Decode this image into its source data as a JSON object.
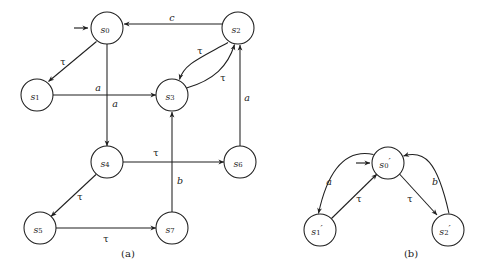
{
  "figure": {
    "background_color": "#ffffff",
    "ink_color": "#1f1f1f",
    "captions": [
      {
        "id": "caption-a",
        "text": "(a)",
        "x": 128,
        "y": 253
      },
      {
        "id": "caption-b",
        "text": "(b)",
        "x": 411,
        "y": 253
      }
    ]
  },
  "diagram_a": {
    "caption": "(a)",
    "initial_state": "s0",
    "nodes": [
      {
        "id": "s0",
        "label": "s",
        "sub": "0",
        "prime": "",
        "cx": 107,
        "cy": 28,
        "r": 16
      },
      {
        "id": "s1",
        "label": "s",
        "sub": "1",
        "prime": "",
        "cx": 37,
        "cy": 95,
        "r": 16
      },
      {
        "id": "s2",
        "label": "s",
        "sub": "2",
        "prime": "",
        "cx": 238,
        "cy": 28,
        "r": 16
      },
      {
        "id": "s3",
        "label": "s",
        "sub": "3",
        "prime": "",
        "cx": 172,
        "cy": 95,
        "r": 16
      },
      {
        "id": "s4",
        "label": "s",
        "sub": "4",
        "prime": "",
        "cx": 107,
        "cy": 162,
        "r": 16
      },
      {
        "id": "s5",
        "label": "s",
        "sub": "5",
        "prime": "",
        "cx": 40,
        "cy": 228,
        "r": 16
      },
      {
        "id": "s6",
        "label": "s",
        "sub": "6",
        "prime": "",
        "cx": 240,
        "cy": 162,
        "r": 16
      },
      {
        "id": "s7",
        "label": "s",
        "sub": "7",
        "prime": "",
        "cx": 172,
        "cy": 228,
        "r": 16
      }
    ],
    "edges": [
      {
        "id": "e-s2-s0",
        "from": "s2",
        "to": "s0",
        "label": "c",
        "kind": "straight",
        "label_x": 172,
        "label_y": 17
      },
      {
        "id": "e-s0-s1",
        "from": "s0",
        "to": "s1",
        "label": "τ",
        "kind": "straight",
        "label_x": 63,
        "label_y": 61
      },
      {
        "id": "e-s0-s4",
        "from": "s0",
        "to": "s4",
        "label": "a",
        "kind": "straight",
        "label_x": 115,
        "label_y": 103
      },
      {
        "id": "e-s1-s3",
        "from": "s1",
        "to": "s3",
        "label": "a",
        "kind": "straight",
        "label_x": 98,
        "label_y": 87
      },
      {
        "id": "e-s2-s3",
        "from": "s2",
        "to": "s3",
        "label": "τ",
        "kind": "curve-left",
        "label_x": 200,
        "label_y": 50
      },
      {
        "id": "e-s3-s2",
        "from": "s3",
        "to": "s2",
        "label": "τ",
        "kind": "curve-right",
        "label_x": 223,
        "label_y": 77
      },
      {
        "id": "e-s6-s2",
        "from": "s6",
        "to": "s2",
        "label": "a",
        "kind": "straight",
        "label_x": 247,
        "label_y": 97
      },
      {
        "id": "e-s4-s6",
        "from": "s4",
        "to": "s6",
        "label": "τ",
        "kind": "straight",
        "label_x": 156,
        "label_y": 152
      },
      {
        "id": "e-s7-s3",
        "from": "s7",
        "to": "s3",
        "label": "b",
        "kind": "straight",
        "label_x": 180,
        "label_y": 180
      },
      {
        "id": "e-s4-s5",
        "from": "s4",
        "to": "s5",
        "label": "τ",
        "kind": "straight",
        "label_x": 80,
        "label_y": 196
      },
      {
        "id": "e-s5-s7",
        "from": "s5",
        "to": "s7",
        "label": "τ",
        "kind": "straight",
        "label_x": 106,
        "label_y": 238
      }
    ]
  },
  "diagram_b": {
    "caption": "(b)",
    "initial_state": "s0p",
    "nodes": [
      {
        "id": "s0p",
        "label": "s",
        "sub": "0",
        "prime": "′",
        "cx": 388,
        "cy": 163,
        "r": 16
      },
      {
        "id": "s1p",
        "label": "s",
        "sub": "1",
        "prime": "′",
        "cx": 320,
        "cy": 230,
        "r": 16
      },
      {
        "id": "s2p",
        "label": "s",
        "sub": "2",
        "prime": "′",
        "cx": 448,
        "cy": 230,
        "r": 16
      }
    ],
    "edges": [
      {
        "id": "e-s0p-s1p",
        "from": "s0p",
        "to": "s1p",
        "label": "a",
        "kind": "curve-out",
        "label_x": 329,
        "label_y": 181
      },
      {
        "id": "e-s1p-s0p",
        "from": "s1p",
        "to": "s0p",
        "label": "τ",
        "kind": "straight",
        "label_x": 359,
        "label_y": 198
      },
      {
        "id": "e-s2p-s0p",
        "from": "s2p",
        "to": "s0p",
        "label": "b",
        "kind": "curve-out",
        "label_x": 435,
        "label_y": 181
      },
      {
        "id": "e-s0p-s2p",
        "from": "s0p",
        "to": "s2p",
        "label": "τ",
        "kind": "straight",
        "label_x": 410,
        "label_y": 198
      }
    ]
  }
}
